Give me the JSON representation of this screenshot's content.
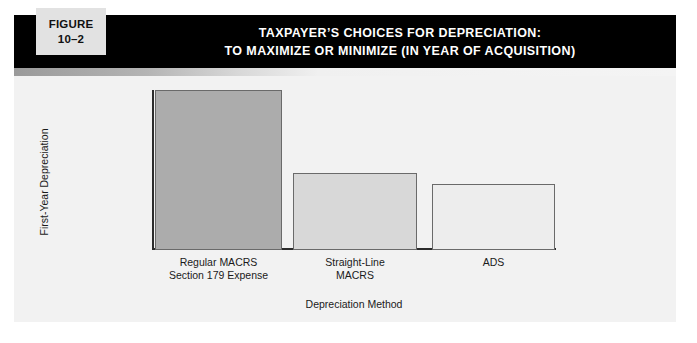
{
  "figure_tab": {
    "label": "FIGURE",
    "number": "10–2"
  },
  "header": {
    "title_line_1": "TAXPAYER’S CHOICES FOR DEPRECIATION:",
    "title_line_2": "TO MAXIMIZE OR MINIMIZE (IN YEAR OF ACQUISITION)",
    "background_color": "#000000",
    "text_color": "#ffffff"
  },
  "panel": {
    "background_color": "#f2f2f2"
  },
  "chart_data": {
    "type": "bar",
    "title": "TAXPAYER’S CHOICES FOR DEPRECIATION: TO MAXIMIZE OR MINIMIZE (IN YEAR OF ACQUISITION)",
    "xlabel": "Depreciation Method",
    "ylabel": "First-Year Depreciation",
    "categories": [
      "Regular MACRS Section 179 Expense",
      "Straight-Line MACRS",
      "ADS"
    ],
    "category_lines": [
      [
        "Regular MACRS",
        "Section 179 Expense"
      ],
      [
        "Straight-Line",
        "MACRS"
      ],
      [
        "ADS"
      ]
    ],
    "values": [
      100,
      48,
      41
    ],
    "ylim": [
      0,
      105
    ],
    "grid": false,
    "legend": false,
    "axis_ticks_shown": false,
    "bar_colors": [
      "#acacac",
      "#d8d8d8",
      "#ededed"
    ],
    "bar_border_color": "#6a6a6a",
    "axis_color": "#2b2b2b"
  }
}
